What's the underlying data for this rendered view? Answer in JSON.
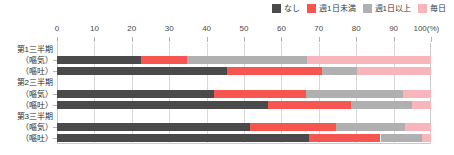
{
  "legend": {
    "items": [
      {
        "label": "なし",
        "color": "#4a4a4a",
        "swatch_name": "legend-swatch-nashi"
      },
      {
        "label": "週1日未満",
        "color": "#f7554f",
        "swatch_name": "legend-swatch-under-once-week"
      },
      {
        "label": "週1日以上",
        "color": "#b0b0b0",
        "swatch_name": "legend-swatch-once-week-or-more"
      },
      {
        "label": "毎日",
        "color": "#f9b5bc",
        "swatch_name": "legend-swatch-daily"
      }
    ]
  },
  "axis": {
    "ticks": [
      "0",
      "10",
      "20",
      "30",
      "40",
      "50",
      "60",
      "70",
      "80",
      "90",
      "100(%)"
    ],
    "unit": "(%)"
  },
  "rows": [
    {
      "label": "第1三半期"
    },
    {
      "label": "（嘔気）"
    },
    {
      "label": "（嘔吐）"
    },
    {
      "label": "第2三半期"
    },
    {
      "label": "（嘔気）"
    },
    {
      "label": "（嘔吐）"
    },
    {
      "label": "第3三半期"
    },
    {
      "label": "（嘔気）"
    },
    {
      "label": "（嘔吐）"
    }
  ],
  "chart_data": {
    "type": "bar",
    "orientation": "horizontal",
    "stacked": true,
    "stacked_percent": true,
    "title": "",
    "xlabel": "(%)",
    "ylabel": "",
    "xlim": [
      0,
      100
    ],
    "xticks": [
      0,
      10,
      20,
      30,
      40,
      50,
      60,
      70,
      80,
      90,
      100
    ],
    "grid": true,
    "legend_position": "top-right",
    "categories": [
      "第1三半期（嘔気）",
      "第1三半期（嘔吐）",
      "第2三半期（嘔気）",
      "第2三半期（嘔吐）",
      "第3三半期（嘔気）",
      "第3三半期（嘔吐）"
    ],
    "series": [
      {
        "name": "なし",
        "color": "#4a4a4a",
        "values": [
          22.5,
          45.5,
          42.0,
          56.5,
          51.5,
          67.5
        ]
      },
      {
        "name": "週1日未満",
        "color": "#f7554f",
        "values": [
          12.3,
          25.4,
          24.5,
          22.0,
          23.0,
          19.0
        ]
      },
      {
        "name": "週1日以上",
        "color": "#b0b0b0",
        "values": [
          32.0,
          9.3,
          26.0,
          16.5,
          18.5,
          11.0
        ]
      },
      {
        "name": "毎日",
        "color": "#f9b5bc",
        "values": [
          33.2,
          19.8,
          7.5,
          5.0,
          7.0,
          2.5
        ]
      }
    ]
  }
}
